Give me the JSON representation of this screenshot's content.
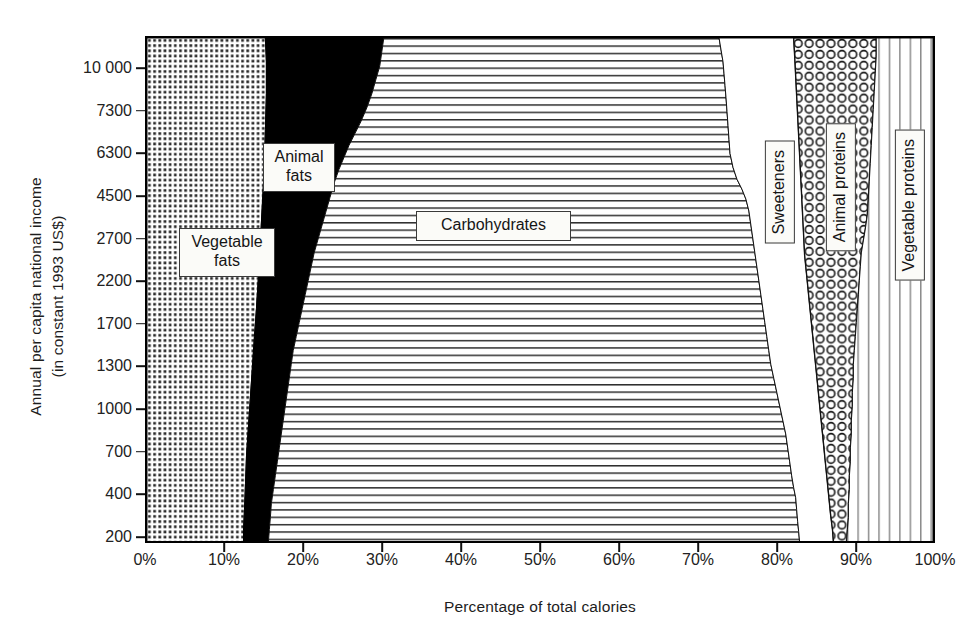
{
  "figure": {
    "x_axis_title": "Percentage of total calories",
    "y_axis_title": "Annual per capita national income\n(in constant 1993 US$)",
    "caption": ""
  },
  "labels": {
    "vegetable_fats": "Vegetable\nfats",
    "animal_fats": "Animal\nfats",
    "carbohydrates": "Carbohydrates",
    "sweeteners": "Sweeteners",
    "animal_proteins": "Animal proteins",
    "vegetable_proteins": "Vegetable proteins"
  },
  "colors": {
    "ink": "#000000",
    "animal_fats_fill": "#000000",
    "sweeteners_fill": "#ffffff",
    "background": "#ffffff"
  },
  "chart_data": {
    "type": "area",
    "title": "",
    "subtitle": "",
    "xlabel": "Percentage of total calories",
    "ylabel": "Annual per capita national income (in constant 1993 US$)",
    "orientation": "horizontal-stacked-area",
    "grid": false,
    "legend": "in-plot callout boxes",
    "xlim": [
      0,
      100
    ],
    "xticks": [
      "0%",
      "10%",
      "20%",
      "30%",
      "40%",
      "50%",
      "60%",
      "70%",
      "80%",
      "90%",
      "100%"
    ],
    "xtick_values": [
      0,
      10,
      20,
      30,
      40,
      50,
      60,
      70,
      80,
      90,
      100
    ],
    "yticks": [
      "200",
      "400",
      "700",
      "1000",
      "1300",
      "1700",
      "2200",
      "2700",
      "4500",
      "6300",
      "7300",
      "10 000"
    ],
    "ytick_values": [
      200,
      400,
      700,
      1000,
      1300,
      1700,
      2200,
      2700,
      4500,
      6300,
      7300,
      10000
    ],
    "y_axis_note": "non-linear income scale, evenly spaced tick rows from 200 (bottom) to 10 000 (top)",
    "series": [
      {
        "name": "Vegetable fats",
        "pattern": "small-square-grid",
        "values_percent_of_calories": [
          9.9,
          10.0,
          10.2,
          10.4,
          10.6,
          10.9,
          11.2,
          11.6,
          12.0,
          12.6,
          13.2,
          13.9,
          14.6,
          15.0,
          15.1
        ]
      },
      {
        "name": "Animal fats",
        "pattern": "solid-black",
        "values_percent_of_calories": [
          2.9,
          3.1,
          3.4,
          3.8,
          4.3,
          5.0,
          6.0,
          7.2,
          8.6,
          10.2,
          11.8,
          13.2,
          14.3,
          14.9,
          15.0
        ]
      },
      {
        "name": "Carbohydrates",
        "pattern": "horizontal-lines",
        "values_percent_of_calories": [
          68.0,
          67.5,
          66.8,
          65.8,
          64.4,
          62.5,
          60.1,
          57.4,
          54.4,
          51.3,
          48.4,
          45.8,
          43.8,
          42.6,
          42.2
        ]
      },
      {
        "name": "Sweeteners",
        "pattern": "blank-white",
        "values_percent_of_calories": [
          4.8,
          5.0,
          5.4,
          5.9,
          6.5,
          7.2,
          7.9,
          8.6,
          9.2,
          9.7,
          10.1,
          10.4,
          10.6,
          10.7,
          10.8
        ]
      },
      {
        "name": "Animal proteins",
        "pattern": "circles",
        "values_percent_of_calories": [
          2.4,
          2.6,
          2.8,
          3.1,
          3.5,
          4.0,
          4.6,
          5.3,
          6.0,
          6.7,
          7.2,
          7.6,
          7.9,
          8.0,
          8.1
        ]
      },
      {
        "name": "Vegetable proteins",
        "pattern": "vertical-lines",
        "values_percent_of_calories": [
          12.0,
          11.8,
          11.4,
          11.0,
          10.7,
          10.4,
          10.2,
          9.9,
          9.8,
          9.5,
          9.3,
          9.1,
          8.8,
          8.8,
          8.8
        ]
      }
    ],
    "boundaries_note": "cumulative band edges sweep from ~15%/17%/83%/88%/90% at the low-income bottom to ~15%/30%/73%/79%/88% at the high-income top"
  }
}
